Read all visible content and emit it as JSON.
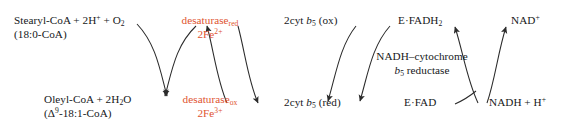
{
  "diagram": {
    "type": "biochemical-reaction-scheme",
    "colors": {
      "background": "#ffffff",
      "text": "#16181a",
      "accent_red": "#e0542f",
      "arrow": "#2b2b2b"
    },
    "labels": {
      "substrate_top_line1": "Stearyl-CoA +  2H",
      "substrate_top_sup": "+",
      "substrate_top_mid": " + O",
      "substrate_top_sub": "2",
      "substrate_top_line2": "(18:0-CoA)",
      "product_bottom_line1a": "Oleyl-CoA + 2H",
      "product_bottom_sub": "2",
      "product_bottom_line1b": "O",
      "product_bottom_line2a": "(Δ",
      "product_bottom_line2sup": "9",
      "product_bottom_line2b": "-18:1-CoA)",
      "desaturase_red_name": "desaturase",
      "desaturase_red_state": "red",
      "desaturase_red_iron": "2Fe",
      "desaturase_red_charge": "2+",
      "desaturase_ox_name": "desaturase",
      "desaturase_ox_state": "ox",
      "desaturase_ox_iron": "2Fe",
      "desaturase_ox_charge": "3+",
      "cyt_ox_pre": "2cyt ",
      "cyt_ox_b": "b",
      "cyt_ox_sub": "5",
      "cyt_ox_post": " (ox)",
      "cyt_red_pre": "2cyt ",
      "cyt_red_b": "b",
      "cyt_red_sub": "5",
      "cyt_red_post": " (red)",
      "e_fadh2_pre": "E·FADH",
      "e_fadh2_sub": "2",
      "e_fad": "E·FAD",
      "reductase_line1": "NADH–cytochrome",
      "reductase_line2a": "b",
      "reductase_line2sub": "5",
      "reductase_line2b": " reductase",
      "nad_plus_base": "NAD",
      "nad_plus_sup": "+",
      "nadh_h_base": "NADH + H",
      "nadh_h_sup": "+"
    },
    "cycles": [
      {
        "id": "cycle-desaturase",
        "arrowheads": "bottom",
        "from_top_left": "Stearyl-CoA + 2H+ + O2",
        "to_bottom_left": "Oleyl-CoA + 2H2O",
        "from_top_right": "desaturase-red 2Fe2+",
        "to_bottom_right": "desaturase-ox 2Fe3+"
      },
      {
        "id": "cycle-cytochrome-b5",
        "arrowheads": "top",
        "from_bottom_right": "2cyt b5 (red)",
        "to_top_right": "2cyt b5 (ox)",
        "from_bottom_left": "desaturase-ox 2Fe3+",
        "to_top_left": "desaturase-red 2Fe2+"
      },
      {
        "id": "cycle-reductase-fad",
        "arrowheads": "bottom",
        "from_top_right": "E-FADH2",
        "to_bottom_left": "2cyt b5 (red)",
        "from_top_left": "2cyt b5 (ox)",
        "to_bottom_right": "E-FAD"
      },
      {
        "id": "cycle-nad",
        "arrowheads": "top",
        "from_bottom_right": "NADH + H+",
        "to_top_right": "NAD+",
        "from_bottom_left": "E-FAD",
        "to_top_left": "E-FADH2"
      }
    ]
  }
}
